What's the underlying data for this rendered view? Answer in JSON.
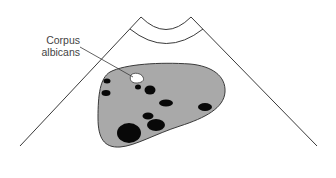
{
  "diagram": {
    "labels": [
      {
        "id": "corpus-albicans",
        "line1": "Corpus",
        "line2": "albicans"
      }
    ],
    "colors": {
      "background": "#ffffff",
      "outline": "#3a3a3a",
      "ovary_fill": "#a9a9a9",
      "follicle_fill": "#080808",
      "corpus_albicans_fill": "#ffffff",
      "label_text": "#444444"
    },
    "structures": {
      "sector": "ultrasound-sector-outline",
      "ovary": "ovary",
      "follicle_count": 11,
      "highlighted": "corpus-albicans"
    }
  }
}
